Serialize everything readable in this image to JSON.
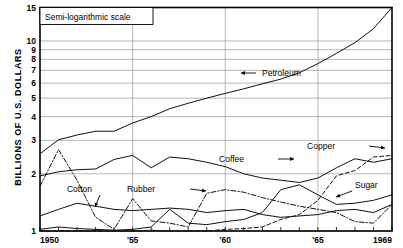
{
  "chart_data": {
    "type": "line",
    "title": "",
    "annotation": "Semi-logarithmic scale",
    "ylabel": "BILLIONS OF U.S. DOLLARS",
    "xlabel": "",
    "scale": "semi-log",
    "grid": true,
    "legend_position": "inline-labels",
    "xlim": [
      1950,
      1969
    ],
    "ylim": [
      1,
      15
    ],
    "ytick_labels": [
      "15",
      "10",
      "9",
      "8",
      "7",
      "6",
      "5",
      "4",
      "3",
      "2",
      "1"
    ],
    "ytick_values": [
      15,
      10,
      9,
      8,
      7,
      6,
      5,
      4,
      3,
      2,
      1
    ],
    "xtick_labels": [
      "1950",
      "'55",
      "'60",
      "'65",
      "1969"
    ],
    "xtick_values": [
      1950,
      1955,
      1960,
      1965,
      1969
    ],
    "x": [
      1950,
      1951,
      1952,
      1953,
      1954,
      1955,
      1956,
      1957,
      1958,
      1959,
      1960,
      1961,
      1962,
      1963,
      1964,
      1965,
      1966,
      1967,
      1968,
      1969
    ],
    "series": [
      {
        "name": "Petroleum",
        "style": "solid",
        "label_anchor": "left-arrow",
        "values": [
          2.55,
          3.02,
          3.2,
          3.35,
          3.35,
          3.7,
          4.0,
          4.4,
          4.7,
          5.0,
          5.3,
          5.6,
          5.95,
          6.3,
          6.8,
          7.6,
          8.6,
          9.8,
          11.6,
          15.0
        ]
      },
      {
        "name": "Coffee",
        "style": "solid",
        "label_anchor": "right-arrow",
        "values": [
          1.95,
          2.05,
          2.1,
          2.12,
          2.38,
          2.5,
          2.15,
          2.45,
          2.4,
          2.3,
          2.18,
          2.0,
          1.9,
          1.85,
          1.8,
          1.9,
          2.15,
          2.4,
          2.3,
          2.4
        ]
      },
      {
        "name": "Cotton",
        "style": "solid",
        "label_anchor": "down-left-arrow",
        "values": [
          1.2,
          1.3,
          1.4,
          1.35,
          1.3,
          1.28,
          1.3,
          1.32,
          1.3,
          1.25,
          1.28,
          1.3,
          1.22,
          1.18,
          1.2,
          1.22,
          1.28,
          1.3,
          1.25,
          1.38
        ]
      },
      {
        "name": "Rubber",
        "style": "dash-dot",
        "label_anchor": "right-arrow",
        "values": [
          1.72,
          2.68,
          1.85,
          1.18,
          1.02,
          1.48,
          1.13,
          1.1,
          1.05,
          1.58,
          1.65,
          1.6,
          1.5,
          1.42,
          1.35,
          1.3,
          1.25,
          1.12,
          1.1,
          1.38
        ]
      },
      {
        "name": "Sugar",
        "style": "solid",
        "label_anchor": "down-left-arrow",
        "values": [
          1.02,
          1.05,
          1.03,
          1.02,
          1.01,
          1.02,
          1.05,
          1.3,
          1.1,
          1.08,
          1.12,
          1.15,
          1.25,
          1.65,
          1.75,
          1.55,
          1.38,
          1.4,
          1.45,
          1.55
        ]
      },
      {
        "name": "Copper",
        "style": "dashed",
        "label_anchor": "right-arrow",
        "values": [
          1.0,
          1.0,
          1.0,
          1.0,
          1.0,
          1.0,
          1.01,
          1.0,
          1.0,
          1.0,
          1.02,
          1.03,
          1.05,
          1.15,
          1.22,
          1.45,
          1.95,
          2.08,
          2.45,
          2.5
        ]
      }
    ],
    "series_labels": [
      {
        "name": "Petroleum",
        "text": "Petroleum",
        "tx": 262,
        "ty": 76,
        "ax1": 256,
        "ay1": 73,
        "ax2": 241,
        "ay2": 73,
        "dir": "left"
      },
      {
        "name": "Coffee",
        "text": "Coffee",
        "tx": 244,
        "ty": 162,
        "ax1": 278,
        "ay1": 159,
        "ax2": 294,
        "ay2": 159,
        "dir": "right"
      },
      {
        "name": "Copper",
        "text": "Copper",
        "tx": 335,
        "ty": 149,
        "ax1": 369,
        "ay1": 146,
        "ax2": 385,
        "ay2": 148,
        "dir": "right"
      },
      {
        "name": "Sugar",
        "text": "Sugar",
        "tx": 355,
        "ty": 188,
        "ax1": 352,
        "ay1": 191,
        "ax2": 336,
        "ay2": 197,
        "dir": "left-down"
      },
      {
        "name": "Cotton",
        "text": "Cotton",
        "tx": 92,
        "ty": 192,
        "ax1": 100,
        "ay1": 195,
        "ax2": 95,
        "ay2": 207,
        "dir": "down"
      },
      {
        "name": "Rubber",
        "text": "Rubber",
        "tx": 155,
        "ty": 192,
        "ax1": 190,
        "ay1": 189,
        "ax2": 206,
        "ay2": 191,
        "dir": "right"
      }
    ]
  }
}
